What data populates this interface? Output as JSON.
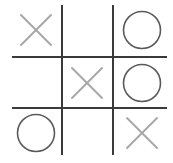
{
  "game": {
    "type": "tic-tac-toe",
    "board": [
      [
        "X",
        "",
        "O"
      ],
      [
        "",
        "X",
        "O"
      ],
      [
        "O",
        "",
        "X"
      ]
    ]
  },
  "colors": {
    "grid": "#3a3a3a",
    "x_mark": "#a8a8a8",
    "o_mark": "#5a5a5a",
    "background": "#ffffff"
  }
}
